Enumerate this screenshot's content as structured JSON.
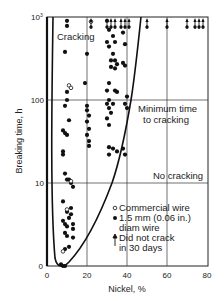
{
  "chart_data": {
    "type": "scatter",
    "title": "",
    "xlabel": "Nickel, %",
    "ylabel": "Breaking time, h",
    "xlim": [
      0,
      80
    ],
    "ylim": [
      1,
      1000
    ],
    "yscale": "log",
    "x_ticks": [
      "0",
      "20",
      "40",
      "60",
      "80"
    ],
    "y_ticks": [
      "0",
      "10",
      "100",
      "10³"
    ],
    "grid": true,
    "annotations": [
      "Cracking",
      "Minimum time to cracking",
      "No cracking"
    ],
    "legend": {
      "position": "lower-right inside",
      "entries": [
        {
          "symbol": "open-circle",
          "label": "Commercial wire"
        },
        {
          "symbol": "filled-circle",
          "label": "1.5 mm (0.06 in.) diam wire"
        },
        {
          "symbol": "up-arrow",
          "label": "Did not crack in 30 days"
        }
      ]
    },
    "series": [
      {
        "name": "1.5 mm (0.06 in.) diam wire",
        "marker": "filled-circle",
        "points": [
          [
            10,
            900
          ],
          [
            10,
            780
          ],
          [
            9,
            380
          ],
          [
            10,
            125
          ],
          [
            10,
            100
          ],
          [
            9,
            85
          ],
          [
            11,
            57
          ],
          [
            8,
            43
          ],
          [
            9,
            40
          ],
          [
            10,
            38
          ],
          [
            8,
            24
          ],
          [
            8,
            22
          ],
          [
            9,
            13
          ],
          [
            10,
            11
          ],
          [
            11,
            11
          ],
          [
            12,
            10
          ],
          [
            13,
            9
          ],
          [
            8,
            6
          ],
          [
            10,
            4.5
          ],
          [
            11,
            3.8
          ],
          [
            12,
            4.2
          ],
          [
            12,
            5
          ],
          [
            8,
            3.5
          ],
          [
            9,
            3.2
          ],
          [
            10,
            3.0
          ],
          [
            13,
            3.2
          ],
          [
            13,
            2.8
          ],
          [
            9,
            2.5
          ],
          [
            10,
            2.3
          ],
          [
            9,
            1.6
          ],
          [
            11,
            1.7
          ],
          [
            13,
            2.2
          ],
          [
            7,
            1.05
          ],
          [
            8,
            1.0
          ],
          [
            9,
            1.0
          ],
          [
            20,
            360
          ],
          [
            19,
            160
          ],
          [
            20,
            85
          ],
          [
            20,
            75
          ],
          [
            21,
            65
          ],
          [
            20,
            55
          ],
          [
            21,
            45
          ],
          [
            20,
            38
          ],
          [
            21,
            32
          ],
          [
            21,
            28
          ],
          [
            30,
            900
          ],
          [
            31,
            700
          ],
          [
            30,
            500
          ],
          [
            31,
            440
          ],
          [
            32,
            300
          ],
          [
            32,
            250
          ],
          [
            31,
            160
          ],
          [
            30,
            130
          ],
          [
            31,
            100
          ],
          [
            30,
            90
          ],
          [
            31,
            80
          ],
          [
            32,
            70
          ],
          [
            30,
            60
          ],
          [
            31,
            50
          ],
          [
            31,
            27
          ],
          [
            31,
            22
          ],
          [
            33,
            590
          ],
          [
            34,
            500
          ],
          [
            33,
            360
          ],
          [
            34,
            300
          ],
          [
            35,
            270
          ],
          [
            34,
            240
          ],
          [
            34,
            130
          ],
          [
            35,
            125
          ],
          [
            33,
            90
          ],
          [
            33,
            26
          ],
          [
            35,
            24
          ],
          [
            38,
            650
          ],
          [
            39,
            470
          ],
          [
            38,
            280
          ],
          [
            39,
            260
          ],
          [
            40,
            110
          ],
          [
            39,
            90
          ],
          [
            40,
            80
          ],
          [
            38,
            26
          ],
          [
            39,
            22
          ]
        ]
      },
      {
        "name": "Commercial wire",
        "marker": "open-circle",
        "points": [
          [
            22,
            880
          ],
          [
            11,
            150
          ],
          [
            12,
            140
          ],
          [
            12,
            10.5
          ],
          [
            10,
            4.8
          ],
          [
            8,
            1.5
          ]
        ]
      },
      {
        "name": "Did not crack in 30 days",
        "marker": "up-arrow",
        "points": [
          [
            22,
            1000
          ],
          [
            30,
            1000
          ],
          [
            32,
            1000
          ],
          [
            34,
            1000
          ],
          [
            37,
            1000
          ],
          [
            39,
            1000
          ],
          [
            41,
            1000
          ],
          [
            50,
            1000
          ],
          [
            60,
            1000
          ],
          [
            70,
            1000
          ],
          [
            74,
            1000
          ],
          [
            76,
            1000
          ],
          [
            78,
            1000
          ]
        ]
      }
    ],
    "curve": {
      "name": "Minimum time to cracking",
      "description": "U-shaped boundary, minimum near 9% Ni at ~1 h, rising steeply on left near 4% Ni and on right through ~28% at 10 h, ~37% at 100 h, ~44% at 1000 h"
    }
  },
  "labels": {
    "ylabel": "Breaking time, h",
    "xlabel": "Nickel, %",
    "cracking": "Cracking",
    "min_time_1": "Minimum time",
    "min_time_2": "to cracking",
    "no_cracking": "No cracking",
    "legend_open": "Commercial wire",
    "legend_filled_1": "1.5 mm (0.06 in.)",
    "legend_filled_2": "diam wire",
    "legend_arrow_1": "Did not crack",
    "legend_arrow_2": "in 30 days",
    "xt0": "0",
    "xt20": "20",
    "xt40": "40",
    "xt60": "60",
    "xt80": "80",
    "yt_bottom": "0",
    "yt10": "10",
    "yt100": "100",
    "yt1000": "10"
  }
}
